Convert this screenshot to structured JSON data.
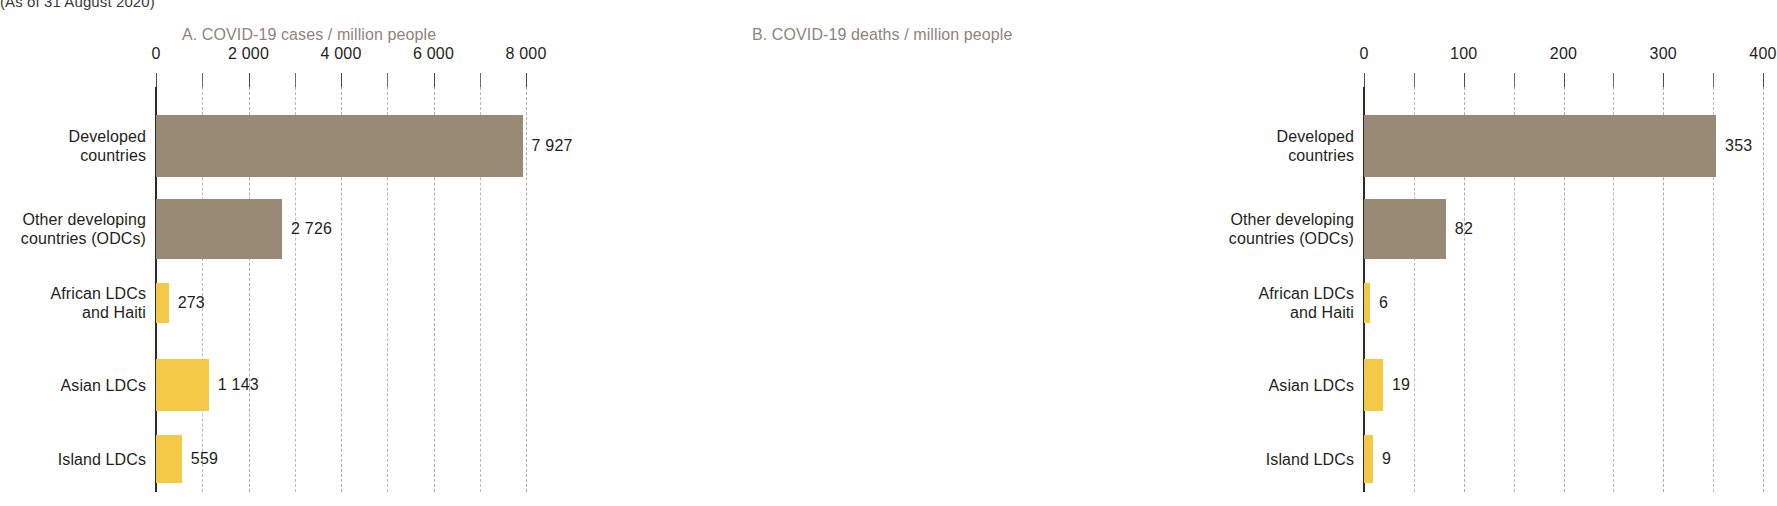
{
  "caption": "(As of 31 August 2020)",
  "colors": {
    "developed_bar": "#988a74",
    "ldc_bar": "#f3c947",
    "title_text": "#8e8579",
    "axis": "#2e2a26",
    "gridline": "#b9b9b9"
  },
  "categories": [
    "Developed\ncountries",
    "Other developing\ncountries (ODCs)",
    "African LDCs\nand Haiti",
    "Asian LDCs",
    "Island LDCs"
  ],
  "category_labels_plain": [
    "Developed countries",
    "Other developing countries (ODCs)",
    "African LDCs and Haiti",
    "Asian LDCs",
    "Island LDCs"
  ],
  "panel_a": {
    "title": "A. COVID-19 cases / million people",
    "tick_labels": [
      "0",
      "2 000",
      "4 000",
      "6 000",
      "8 000"
    ],
    "value_labels": [
      "7 927",
      "2 726",
      "273",
      "1 143",
      "559"
    ]
  },
  "panel_b": {
    "title": "B. COVID-19 deaths / million people",
    "tick_labels": [
      "0",
      "100",
      "200",
      "300",
      "400"
    ],
    "value_labels": [
      "353",
      "82",
      "6",
      "19",
      "9"
    ]
  },
  "chart_data": [
    {
      "type": "bar",
      "orientation": "horizontal",
      "title": "A. COVID-19 cases / million people",
      "subtitle": "(As of 31 August 2020)",
      "xlabel": "",
      "ylabel": "",
      "categories": [
        "Developed countries",
        "Other developing countries (ODCs)",
        "African LDCs and Haiti",
        "Asian LDCs",
        "Island LDCs"
      ],
      "values": [
        7927,
        2726,
        273,
        1143,
        559
      ],
      "bar_colors": [
        "#988a74",
        "#988a74",
        "#f3c947",
        "#f3c947",
        "#f3c947"
      ],
      "xlim": [
        0,
        8000
      ],
      "xticks": [
        0,
        2000,
        4000,
        6000,
        8000
      ],
      "xtick_labels": [
        "0",
        "2 000",
        "4 000",
        "6 000",
        "8 000"
      ],
      "minor_xticks": [
        1000,
        3000,
        5000,
        7000
      ],
      "grid": true,
      "grid_style": "dashed",
      "legend": "none"
    },
    {
      "type": "bar",
      "orientation": "horizontal",
      "title": "B. COVID-19 deaths / million people",
      "subtitle": "(As of 31 August 2020)",
      "xlabel": "",
      "ylabel": "",
      "categories": [
        "Developed countries",
        "Other developing countries (ODCs)",
        "African LDCs and Haiti",
        "Asian LDCs",
        "Island LDCs"
      ],
      "values": [
        353,
        82,
        6,
        19,
        9
      ],
      "bar_colors": [
        "#988a74",
        "#988a74",
        "#f3c947",
        "#f3c947",
        "#f3c947"
      ],
      "xlim": [
        0,
        400
      ],
      "xticks": [
        0,
        100,
        200,
        300,
        400
      ],
      "xtick_labels": [
        "0",
        "100",
        "200",
        "300",
        "400"
      ],
      "minor_xticks": [
        50,
        150,
        250,
        350
      ],
      "grid": true,
      "grid_style": "dashed",
      "legend": "none"
    }
  ]
}
